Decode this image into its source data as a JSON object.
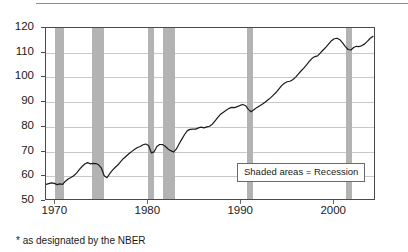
{
  "figure": {
    "footnote": "* as designated by the NBER",
    "legend_label": "Shaded areas = Recession"
  },
  "chart_data": {
    "type": "line",
    "title": "",
    "subtitle": "",
    "xlabel": "",
    "ylabel": "",
    "xlim": [
      1969.0,
      2004.5
    ],
    "ylim": [
      50,
      120
    ],
    "grid": true,
    "grid_axis": "y",
    "legend_position": "inside-bottom-right",
    "legend_entries": [
      "Shaded areas = Recession"
    ],
    "annotations": [
      "* as designated by the NBER"
    ],
    "xticks": [
      1970,
      1980,
      1990,
      2000
    ],
    "xtick_labels": [
      "1970",
      "1980",
      "1990",
      "2000"
    ],
    "yticks": [
      50,
      60,
      70,
      80,
      90,
      100,
      110,
      120
    ],
    "ytick_labels": [
      "50",
      "60",
      "70",
      "80",
      "90",
      "100",
      "110",
      "120"
    ],
    "line_color": "#1a1a1a",
    "shade_color": "#b3b3b3",
    "recessions": [
      {
        "start": 1969.92,
        "end": 1970.92
      },
      {
        "start": 1973.92,
        "end": 1975.25
      },
      {
        "start": 1980.0,
        "end": 1980.58
      },
      {
        "start": 1981.58,
        "end": 1982.92
      },
      {
        "start": 1990.58,
        "end": 1991.25
      },
      {
        "start": 2001.25,
        "end": 2001.92
      }
    ],
    "series": [
      {
        "name": "Industrial Production Index",
        "x": [
          1969.0,
          1969.3,
          1969.6,
          1969.9,
          1970.2,
          1970.5,
          1970.8,
          1971.1,
          1971.4,
          1971.7,
          1972.0,
          1972.3,
          1972.6,
          1972.9,
          1973.2,
          1973.5,
          1973.8,
          1974.1,
          1974.4,
          1974.7,
          1975.0,
          1975.3,
          1975.6,
          1975.9,
          1976.2,
          1976.5,
          1976.8,
          1977.1,
          1977.4,
          1977.7,
          1978.0,
          1978.3,
          1978.6,
          1978.9,
          1979.2,
          1979.5,
          1979.8,
          1980.1,
          1980.4,
          1980.7,
          1981.0,
          1981.3,
          1981.6,
          1981.9,
          1982.2,
          1982.5,
          1982.8,
          1983.1,
          1983.4,
          1983.7,
          1984.0,
          1984.3,
          1984.6,
          1984.9,
          1985.2,
          1985.5,
          1985.8,
          1986.1,
          1986.4,
          1986.7,
          1987.0,
          1987.3,
          1987.6,
          1987.9,
          1988.2,
          1988.5,
          1988.8,
          1989.1,
          1989.4,
          1989.7,
          1990.0,
          1990.3,
          1990.6,
          1990.9,
          1991.2,
          1991.5,
          1991.8,
          1992.1,
          1992.4,
          1992.7,
          1993.0,
          1993.3,
          1993.6,
          1993.9,
          1994.2,
          1994.5,
          1994.8,
          1995.1,
          1995.4,
          1995.7,
          1996.0,
          1996.3,
          1996.6,
          1996.9,
          1997.2,
          1997.5,
          1997.8,
          1998.1,
          1998.4,
          1998.7,
          1999.0,
          1999.3,
          1999.6,
          1999.9,
          2000.2,
          2000.5,
          2000.8,
          2001.1,
          2001.4,
          2001.7,
          2002.0,
          2002.3,
          2002.6,
          2002.9,
          2003.2,
          2003.5,
          2003.8,
          2004.1,
          2004.4
        ],
        "y": [
          56.0,
          56.3,
          56.6,
          56.4,
          55.9,
          56.2,
          56.0,
          57.3,
          58.2,
          58.8,
          59.5,
          60.6,
          62.0,
          63.3,
          64.3,
          64.9,
          64.4,
          64.6,
          64.5,
          64.0,
          62.6,
          59.5,
          58.7,
          60.4,
          61.8,
          63.0,
          64.0,
          65.4,
          66.6,
          67.6,
          68.6,
          69.5,
          70.4,
          71.1,
          71.5,
          72.2,
          72.5,
          71.9,
          68.9,
          69.3,
          71.5,
          72.3,
          72.3,
          71.6,
          70.5,
          69.8,
          69.2,
          70.4,
          72.5,
          74.5,
          76.4,
          78.0,
          78.5,
          78.6,
          78.6,
          79.1,
          79.4,
          79.1,
          79.5,
          79.8,
          80.6,
          82.0,
          83.4,
          84.7,
          85.5,
          86.3,
          87.1,
          87.5,
          87.4,
          87.8,
          88.3,
          88.7,
          88.2,
          86.7,
          85.7,
          86.5,
          87.4,
          88.1,
          88.8,
          89.6,
          90.5,
          91.4,
          92.5,
          93.6,
          95.0,
          96.4,
          97.4,
          98.0,
          98.2,
          98.8,
          99.8,
          101.1,
          102.4,
          103.6,
          104.9,
          106.3,
          107.6,
          108.3,
          108.6,
          109.8,
          111.0,
          112.2,
          113.5,
          114.8,
          115.6,
          115.8,
          115.2,
          113.9,
          112.4,
          111.2,
          111.0,
          112.0,
          112.5,
          112.4,
          112.8,
          113.5,
          114.6,
          115.8,
          116.6
        ]
      }
    ]
  }
}
